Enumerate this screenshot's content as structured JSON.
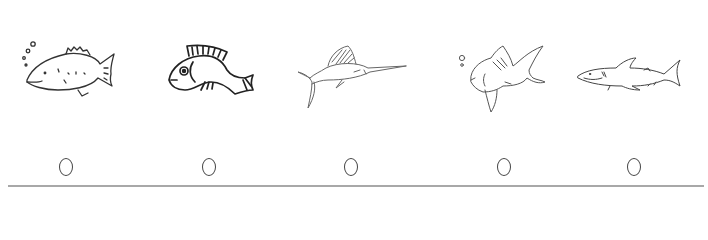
{
  "question": {
    "type": "picture-choice",
    "options": [
      {
        "id": "a",
        "picture": "fish-with-bubbles-icon",
        "description": "Sketched bulky fish with bubbles",
        "selected": false
      },
      {
        "id": "b",
        "picture": "cartoon-fish-icon",
        "description": "Bold-outline cartoon fish",
        "selected": false
      },
      {
        "id": "c",
        "picture": "sailfish-icon",
        "description": "Sketched sailfish / marlin",
        "selected": false
      },
      {
        "id": "d",
        "picture": "goldfish-with-bubbles-icon",
        "description": "Sketched goldfish with bubbles",
        "selected": false
      },
      {
        "id": "e",
        "picture": "shark-icon",
        "description": "Sketched shark / tuna",
        "selected": false
      }
    ]
  },
  "colors": {
    "ink": "#333333",
    "light_ink": "#777777",
    "radio_border": "#444444",
    "divider": "#a8a8a8"
  }
}
